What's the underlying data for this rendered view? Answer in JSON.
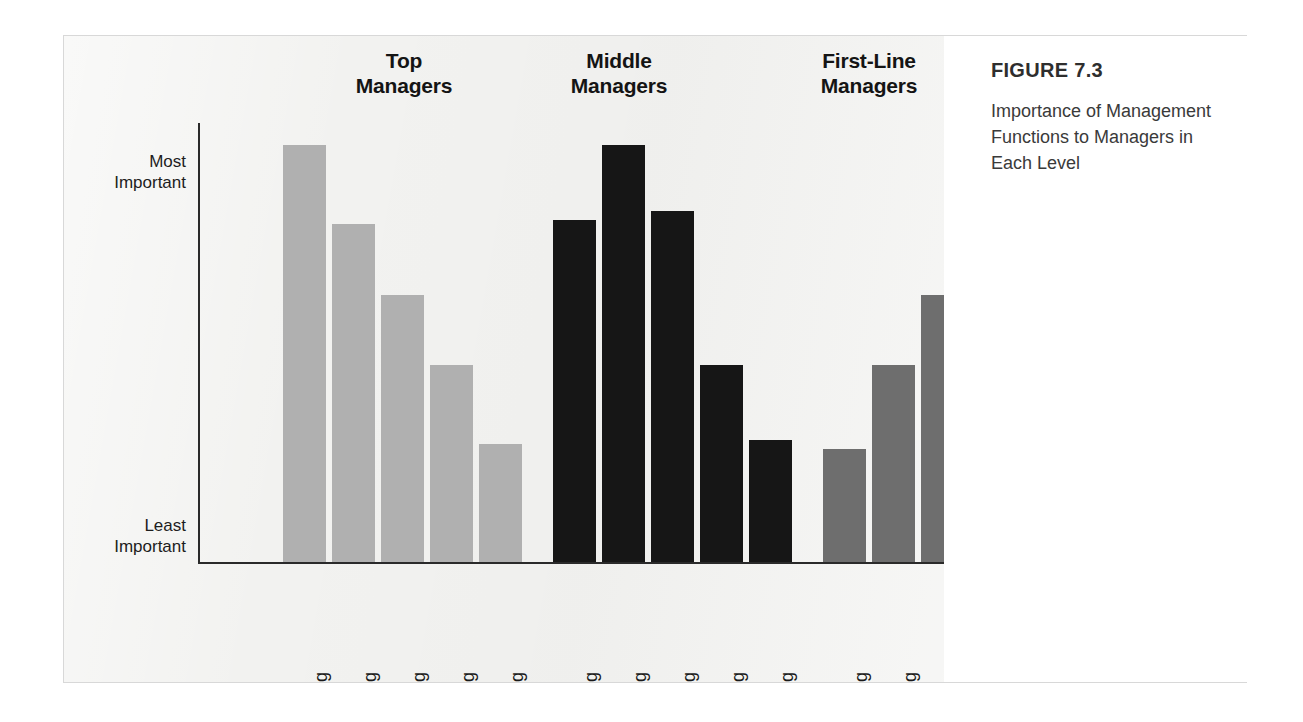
{
  "figure": {
    "title": "FIGURE 7.3",
    "caption": "Importance of Management Functions to Managers in Each Level"
  },
  "colors": {
    "top_managers": "#b0b0b0",
    "middle_managers": "#161616",
    "first_line_managers": "#6e6e6e",
    "panel_background": "#f2f2f0",
    "axis": "#2a2a2a",
    "caption_background": "#ffffff"
  },
  "chart_data": {
    "type": "bar",
    "title": "Importance of Management Functions to Managers in Each Level",
    "xlabel": "",
    "ylabel": "",
    "grid": false,
    "legend": "none",
    "group_label_position": "top",
    "ylim": [
      0,
      100
    ],
    "ytick_labels": [
      "Most\nImportant",
      "Least\nImportant"
    ],
    "ytick_values": [
      95,
      2
    ],
    "categories": [
      "Planning",
      "Organizing",
      "Staffing",
      "Directing",
      "Controlling"
    ],
    "groups": [
      {
        "name": "Top\nManagers",
        "plain_name": "Top Managers",
        "color": "#b0b0b0",
        "values": [
          95,
          77,
          61,
          45,
          27
        ]
      },
      {
        "name": "Middle\nManagers",
        "plain_name": "Middle Managers",
        "color": "#161616",
        "values": [
          78,
          95,
          80,
          45,
          28
        ]
      },
      {
        "name": "First-Line\nManagers",
        "plain_name": "First-Line Managers",
        "color": "#6e6e6e",
        "values": [
          26,
          45,
          61,
          78,
          95
        ]
      }
    ],
    "series": [
      {
        "name": "Top Managers",
        "values": [
          95,
          77,
          61,
          45,
          27
        ]
      },
      {
        "name": "Middle Managers",
        "values": [
          78,
          95,
          80,
          45,
          28
        ]
      },
      {
        "name": "First-Line Managers",
        "values": [
          26,
          45,
          61,
          78,
          95
        ]
      }
    ]
  }
}
